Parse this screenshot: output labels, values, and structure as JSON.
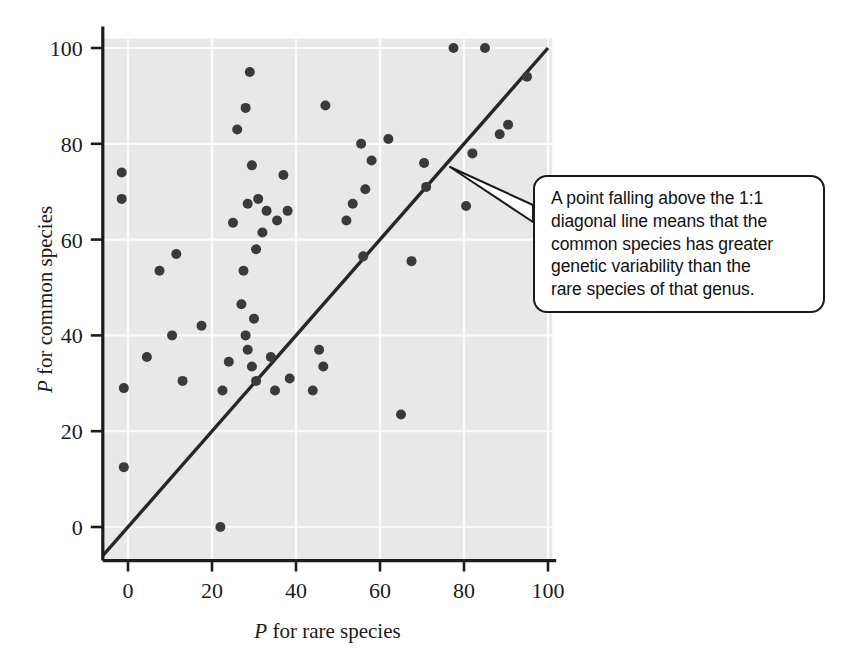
{
  "figure": {
    "background_color": "#ffffff",
    "plot_background_color": "#e8e8e8",
    "gridline_color": "#fbfbfb",
    "axis_color": "#1b1b1b",
    "point_color": "#3a3a3a",
    "line_color": "#262626"
  },
  "axes": {
    "x_label_prefix": "P",
    "x_label_rest": " for rare species",
    "y_label_prefix": "P",
    "y_label_rest": " for common species",
    "x_ticks": [
      "0",
      "20",
      "40",
      "60",
      "80",
      "100"
    ],
    "y_ticks": [
      "0",
      "20",
      "40",
      "60",
      "80",
      "100"
    ]
  },
  "callout": {
    "text": "A point falling above the 1:1 diagonal line means that the common species has greater genetic variability than the rare species of that genus.",
    "line1": "A point falling above the 1:1",
    "line2": "diagonal line means that the",
    "line3": "common species has greater",
    "line4": "genetic variability than the",
    "line5": "rare species of that genus."
  },
  "chart_data": {
    "type": "scatter",
    "title": "",
    "xlabel": "P for rare species",
    "ylabel": "P for common species",
    "xlim": [
      -6,
      101
    ],
    "ylim": [
      -7,
      102
    ],
    "x_ticks": [
      0,
      20,
      40,
      60,
      80,
      100
    ],
    "y_ticks": [
      0,
      20,
      40,
      60,
      80,
      100
    ],
    "grid": true,
    "legend": "none",
    "reference_line": {
      "label": "1:1 diagonal line",
      "slope": 1,
      "intercept": 0,
      "x_from": -6,
      "x_to": 100
    },
    "series": [
      {
        "name": "genus pairs",
        "marker": "filled-circle",
        "points": [
          [
            -1.5,
            74.0
          ],
          [
            -1.5,
            68.5
          ],
          [
            -1.0,
            29.0
          ],
          [
            -1.0,
            12.5
          ],
          [
            4.5,
            35.5
          ],
          [
            7.5,
            53.5
          ],
          [
            10.5,
            40.0
          ],
          [
            11.5,
            57.0
          ],
          [
            13.0,
            30.5
          ],
          [
            17.5,
            42.0
          ],
          [
            22.0,
            0.0
          ],
          [
            22.5,
            28.5
          ],
          [
            24.0,
            34.5
          ],
          [
            25.0,
            63.5
          ],
          [
            26.0,
            83.0
          ],
          [
            27.0,
            46.5
          ],
          [
            27.5,
            53.5
          ],
          [
            28.0,
            87.5
          ],
          [
            28.0,
            40.0
          ],
          [
            28.5,
            37.0
          ],
          [
            28.5,
            67.5
          ],
          [
            29.0,
            95.0
          ],
          [
            29.5,
            75.5
          ],
          [
            29.5,
            33.5
          ],
          [
            30.0,
            43.5
          ],
          [
            30.5,
            58.0
          ],
          [
            30.5,
            30.5
          ],
          [
            31.0,
            68.5
          ],
          [
            32.0,
            61.5
          ],
          [
            33.0,
            66.0
          ],
          [
            34.0,
            35.5
          ],
          [
            35.0,
            28.5
          ],
          [
            35.5,
            64.0
          ],
          [
            37.0,
            73.5
          ],
          [
            38.0,
            66.0
          ],
          [
            38.5,
            31.0
          ],
          [
            44.0,
            28.5
          ],
          [
            45.5,
            37.0
          ],
          [
            46.5,
            33.5
          ],
          [
            47.0,
            88.0
          ],
          [
            52.0,
            64.0
          ],
          [
            53.5,
            67.5
          ],
          [
            55.5,
            80.0
          ],
          [
            56.0,
            56.5
          ],
          [
            56.5,
            70.5
          ],
          [
            58.0,
            76.5
          ],
          [
            62.0,
            81.0
          ],
          [
            65.0,
            23.5
          ],
          [
            67.5,
            55.5
          ],
          [
            70.5,
            76.0
          ],
          [
            71.0,
            71.0
          ],
          [
            77.5,
            100.0
          ],
          [
            80.5,
            67.0
          ],
          [
            82.0,
            78.0
          ],
          [
            85.0,
            100.0
          ],
          [
            88.5,
            82.0
          ],
          [
            90.5,
            84.0
          ],
          [
            95.0,
            94.0
          ]
        ]
      }
    ]
  }
}
